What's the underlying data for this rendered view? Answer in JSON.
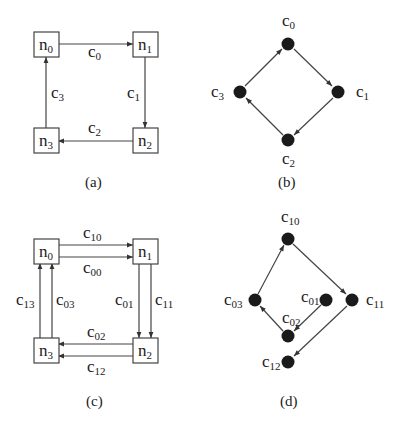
{
  "figure": {
    "panels": [
      {
        "id": "a",
        "caption": "(a)",
        "type": "network",
        "nodes": [
          {
            "id": "n0",
            "base": "n",
            "sub": "0"
          },
          {
            "id": "n1",
            "base": "n",
            "sub": "1"
          },
          {
            "id": "n2",
            "base": "n",
            "sub": "2"
          },
          {
            "id": "n3",
            "base": "n",
            "sub": "3"
          }
        ],
        "edges": [
          {
            "from": "n0",
            "to": "n1",
            "base": "c",
            "sub": "0"
          },
          {
            "from": "n1",
            "to": "n2",
            "base": "c",
            "sub": "1"
          },
          {
            "from": "n2",
            "to": "n3",
            "base": "c",
            "sub": "2"
          },
          {
            "from": "n3",
            "to": "n0",
            "base": "c",
            "sub": "3"
          }
        ]
      },
      {
        "id": "b",
        "caption": "(b)",
        "type": "dependency-graph",
        "nodes": [
          {
            "id": "c0",
            "base": "c",
            "sub": "0"
          },
          {
            "id": "c1",
            "base": "c",
            "sub": "1"
          },
          {
            "id": "c2",
            "base": "c",
            "sub": "2"
          },
          {
            "id": "c3",
            "base": "c",
            "sub": "3"
          }
        ],
        "edges": [
          {
            "from": "c0",
            "to": "c1"
          },
          {
            "from": "c1",
            "to": "c2"
          },
          {
            "from": "c2",
            "to": "c3"
          },
          {
            "from": "c3",
            "to": "c0"
          }
        ]
      },
      {
        "id": "c",
        "caption": "(c)",
        "type": "network",
        "nodes": [
          {
            "id": "n0",
            "base": "n",
            "sub": "0"
          },
          {
            "id": "n1",
            "base": "n",
            "sub": "1"
          },
          {
            "id": "n2",
            "base": "n",
            "sub": "2"
          },
          {
            "id": "n3",
            "base": "n",
            "sub": "3"
          }
        ],
        "edges": [
          {
            "from": "n0",
            "to": "n1",
            "base": "c",
            "sub": "10"
          },
          {
            "from": "n0",
            "to": "n1",
            "base": "c",
            "sub": "00"
          },
          {
            "from": "n1",
            "to": "n2",
            "base": "c",
            "sub": "01"
          },
          {
            "from": "n1",
            "to": "n2",
            "base": "c",
            "sub": "11"
          },
          {
            "from": "n2",
            "to": "n3",
            "base": "c",
            "sub": "02"
          },
          {
            "from": "n2",
            "to": "n3",
            "base": "c",
            "sub": "12"
          },
          {
            "from": "n3",
            "to": "n0",
            "base": "c",
            "sub": "13"
          },
          {
            "from": "n3",
            "to": "n0",
            "base": "c",
            "sub": "03"
          }
        ]
      },
      {
        "id": "d",
        "caption": "(d)",
        "type": "dependency-graph",
        "nodes": [
          {
            "id": "c10",
            "base": "c",
            "sub": "10"
          },
          {
            "id": "c11",
            "base": "c",
            "sub": "11"
          },
          {
            "id": "c03",
            "base": "c",
            "sub": "03"
          },
          {
            "id": "c01",
            "base": "c",
            "sub": "01"
          },
          {
            "id": "c02",
            "base": "c",
            "sub": "02"
          },
          {
            "id": "c12",
            "base": "c",
            "sub": "12"
          }
        ],
        "edges": [
          {
            "from": "c10",
            "to": "c11"
          },
          {
            "from": "c11",
            "to": "c12"
          },
          {
            "from": "c01",
            "to": "c02"
          },
          {
            "from": "c02",
            "to": "c03"
          },
          {
            "from": "c03",
            "to": "c10"
          }
        ]
      }
    ]
  },
  "labels": {
    "n": "n",
    "c": "c",
    "s0": "0",
    "s1": "1",
    "s2": "2",
    "s3": "3",
    "s00": "00",
    "s01": "01",
    "s02": "02",
    "s03": "03",
    "s10": "10",
    "s11": "11",
    "s12": "12",
    "s13": "13",
    "cap_a": "(a)",
    "cap_b": "(b)",
    "cap_c": "(c)",
    "cap_d": "(d)"
  },
  "colors": {
    "line": "#444444",
    "node_fill": "#1a1a1a",
    "background": "#ffffff"
  }
}
